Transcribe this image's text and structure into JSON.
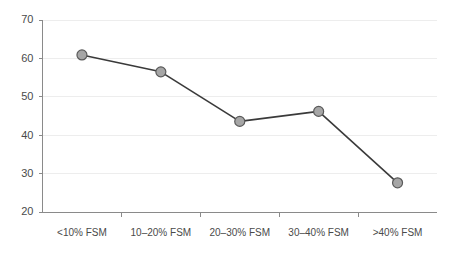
{
  "chart_data": {
    "type": "line",
    "title": "",
    "subtitle": "",
    "xlabel": "",
    "ylabel": "",
    "categories": [
      "<10% FSM",
      "10–20% FSM",
      "20–30% FSM",
      "30–40% FSM",
      ">40% FSM"
    ],
    "values": [
      60.9,
      56.5,
      43.6,
      46.2,
      27.6
    ],
    "series": [
      {
        "name": "",
        "values": [
          60.9,
          56.5,
          43.6,
          46.2,
          27.6
        ]
      }
    ],
    "ylim": [
      20,
      70
    ],
    "yticks": [
      20,
      30,
      40,
      50,
      60,
      70
    ],
    "ytick_labels": [
      "20",
      "30",
      "40",
      "50",
      "60",
      "70"
    ],
    "grid": true,
    "grid_axis": "y",
    "legend": false,
    "legend_position": "none",
    "marker": "circle",
    "colors": {
      "line": "#3a3a3a",
      "marker_fill": "#a6a6a6",
      "marker_stroke": "#5a5a5a",
      "gridline": "#ededed",
      "axis": "#8a8a8a",
      "tick_text": "#4a4a4a",
      "background": "#ffffff"
    }
  }
}
